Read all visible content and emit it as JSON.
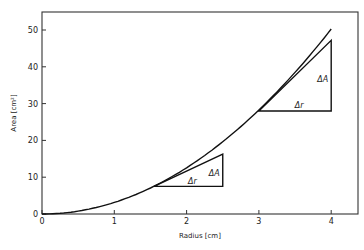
{
  "chart_data": {
    "type": "line",
    "title": "",
    "xlabel": "Radius  [cm]",
    "ylabel": "Area  [cm²]",
    "xlim": [
      0,
      4.25
    ],
    "ylim": [
      0,
      55
    ],
    "xticks": [
      0,
      1,
      2,
      3,
      4
    ],
    "yticks": [
      0,
      10,
      20,
      30,
      40,
      50
    ],
    "grid": false,
    "legend": null,
    "series": [
      {
        "name": "A = πr²",
        "x": [
          0,
          0.25,
          0.5,
          0.75,
          1.0,
          1.25,
          1.5,
          1.75,
          2.0,
          2.25,
          2.5,
          2.75,
          3.0,
          3.25,
          3.5,
          3.75,
          4.0
        ],
        "values": [
          0,
          0.2,
          0.79,
          1.77,
          3.14,
          4.91,
          7.07,
          9.62,
          12.57,
          15.9,
          19.63,
          23.76,
          28.27,
          33.18,
          38.48,
          44.18,
          50.27
        ]
      }
    ],
    "annotations": [
      {
        "kind": "slope-triangle",
        "base_label": "Δr",
        "rise_label": "ΔA",
        "x0": 1.55,
        "y0": 7.5,
        "x1": 2.5,
        "y1": 16.3
      },
      {
        "kind": "slope-triangle",
        "base_label": "Δr",
        "rise_label": "ΔA",
        "x0": 3.0,
        "y0": 28.0,
        "x1": 4.0,
        "y1": 47.2
      }
    ]
  },
  "labels": {
    "xlabel": "Radius  [cm]",
    "ylabel": "Area  [cm²]",
    "delta_r": "Δr",
    "delta_a": "ΔA",
    "xticks": [
      "0",
      "1",
      "2",
      "3",
      "4"
    ],
    "yticks": [
      "0",
      "10",
      "20",
      "30",
      "40",
      "50"
    ]
  }
}
